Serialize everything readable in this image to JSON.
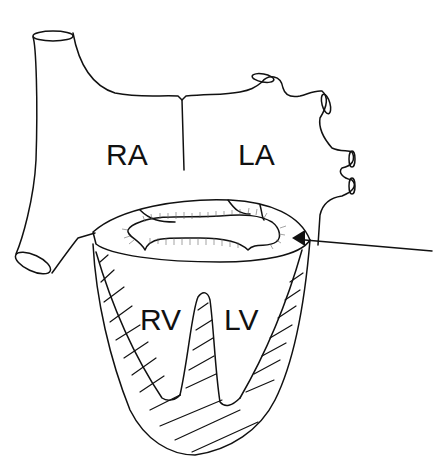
{
  "diagram": {
    "labels": {
      "ra": "RA",
      "la": "LA",
      "rv": "RV",
      "lv": "LV"
    },
    "colors": {
      "stroke": "#111111",
      "background": "#ffffff",
      "fringe": "#666666"
    },
    "pointer": {
      "type": "arrow",
      "target": "mitral annulus"
    }
  }
}
